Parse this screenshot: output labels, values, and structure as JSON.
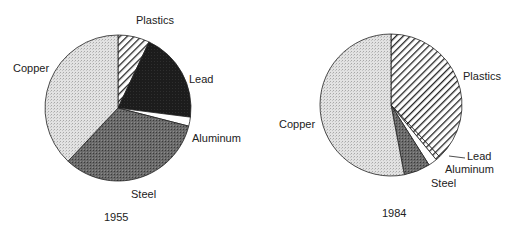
{
  "chart_data": [
    {
      "type": "pie",
      "title": "1955",
      "center": [
        118,
        108
      ],
      "radius": 73,
      "start_angle_deg": 0,
      "direction": "clockwise",
      "slices": [
        {
          "label": "Plastics",
          "value": 7,
          "pattern": "hatch"
        },
        {
          "label": "Lead",
          "value": 20,
          "pattern": "black"
        },
        {
          "label": "Aluminum",
          "value": 2,
          "pattern": "white"
        },
        {
          "label": "Steel",
          "value": 33,
          "pattern": "dark"
        },
        {
          "label": "Copper",
          "value": 38,
          "pattern": "light"
        }
      ]
    },
    {
      "type": "pie",
      "title": "1984",
      "center": [
        391,
        105
      ],
      "radius": 71,
      "start_angle_deg": 0,
      "direction": "clockwise",
      "slices": [
        {
          "label": "Plastics",
          "value": 38,
          "pattern": "hatch"
        },
        {
          "label": "Lead",
          "value": 1,
          "pattern": "hatch"
        },
        {
          "label": "Aluminum",
          "value": 2,
          "pattern": "white"
        },
        {
          "label": "Steel",
          "value": 6,
          "pattern": "dark"
        },
        {
          "label": "Copper",
          "value": 53,
          "pattern": "light"
        }
      ]
    }
  ],
  "labels": {
    "c1955": {
      "plastics": "Plastics",
      "lead": "Lead",
      "aluminum": "Aluminum",
      "steel": "Steel",
      "copper": "Copper",
      "year": "1955"
    },
    "c1984": {
      "plastics": "Plastics",
      "lead": "Lead",
      "aluminum": "Aluminum",
      "steel": "Steel",
      "copper": "Copper",
      "year": "1984"
    }
  }
}
